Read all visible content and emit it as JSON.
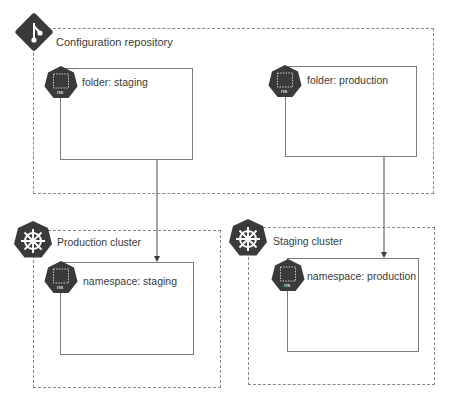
{
  "repository": {
    "title": "Configuration repository",
    "icon": "git-icon",
    "folders": [
      {
        "label": "folder: staging",
        "icon": "namespace-icon",
        "icon_text": "ns"
      },
      {
        "label": "folder: production",
        "icon": "namespace-icon",
        "icon_text": "ns"
      }
    ]
  },
  "clusters": [
    {
      "title": "Production cluster",
      "icon": "kubernetes-icon",
      "namespace": {
        "label": "namespace: staging",
        "icon": "namespace-icon",
        "icon_text": "ns"
      }
    },
    {
      "title": "Staging cluster",
      "icon": "kubernetes-icon",
      "namespace": {
        "label": "namespace: production",
        "icon": "namespace-icon",
        "icon_text": "ns"
      }
    }
  ],
  "connections": [
    {
      "from": "folder: staging",
      "to": "namespace: staging"
    },
    {
      "from": "folder: production",
      "to": "namespace: production"
    }
  ],
  "colors": {
    "icon_fill": "#3a3a3a",
    "line": "#7a7a7a",
    "dashed": "#8a8a8a"
  }
}
